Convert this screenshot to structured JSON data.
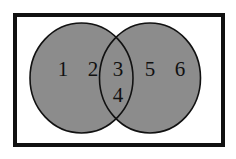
{
  "diagram": {
    "type": "venn",
    "universe": {
      "x": 13,
      "y": 13,
      "width": 212,
      "height": 134,
      "border_color": "#111111",
      "border_width": 4,
      "fill": "#ffffff"
    },
    "sets": [
      {
        "name": "left-set",
        "cx": 81.5,
        "cy": 78,
        "rx": 51.5,
        "ry": 55,
        "fill": "#8c8c8c",
        "stroke": "#111111"
      },
      {
        "name": "right-set",
        "cx": 150,
        "cy": 78,
        "rx": 50.5,
        "ry": 55,
        "fill": "#8c8c8c",
        "stroke": "#111111"
      }
    ],
    "elements": [
      {
        "label": "1",
        "x": 63,
        "y": 76,
        "region": "left-only"
      },
      {
        "label": "2",
        "x": 93,
        "y": 76,
        "region": "left-only"
      },
      {
        "label": "3",
        "x": 118,
        "y": 76,
        "region": "intersection"
      },
      {
        "label": "4",
        "x": 118,
        "y": 102,
        "region": "intersection"
      },
      {
        "label": "5",
        "x": 150,
        "y": 76,
        "region": "right-only"
      },
      {
        "label": "6",
        "x": 180,
        "y": 76,
        "region": "right-only"
      }
    ]
  }
}
